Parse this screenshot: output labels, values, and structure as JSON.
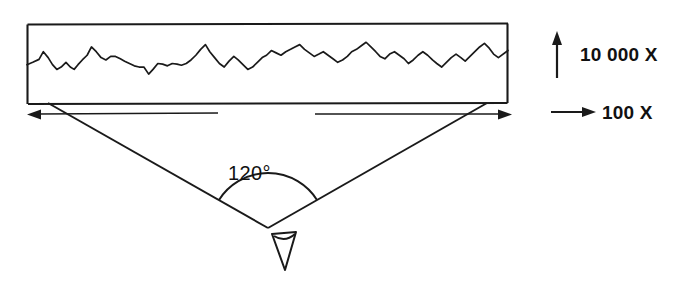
{
  "figure": {
    "background_color": "#ffffff",
    "ink_color": "#1a1a1a",
    "width": 677,
    "height": 281
  },
  "profile_box": {
    "name": "profile-trace-frame",
    "x": 27,
    "y": 24,
    "width": 481,
    "height": 79
  },
  "angle": {
    "value_label": "120°",
    "degrees": 120,
    "vertex_x": 268,
    "vertex_y": 228
  },
  "legend": {
    "vertical": {
      "label": "10 000 X",
      "magnification": 10000,
      "axis": "vertical",
      "icon": "up-arrow-icon"
    },
    "horizontal": {
      "label": "100 X",
      "magnification": 100,
      "axis": "horizontal",
      "icon": "right-arrow-icon"
    }
  },
  "dimension_arrows": {
    "left": {
      "name": "left-extent-arrow",
      "direction": "left"
    },
    "right": {
      "name": "right-extent-arrow",
      "direction": "right"
    }
  },
  "observer": {
    "name": "eye-symbol",
    "description": "eye viewing symbol at angle vertex"
  },
  "chart_data": {
    "type": "line",
    "xlabel": "",
    "ylabel": "",
    "grid": false,
    "legend_position": "right",
    "axis_note": "vertical magnification 10 000 X, horizontal magnification 100 X",
    "xlim": [
      0,
      100
    ],
    "ylim": [
      0,
      100
    ],
    "x": [
      0,
      1.2,
      2.5,
      3.4,
      4.4,
      5.3,
      6.2,
      7.1,
      8.1,
      9.0,
      9.8,
      10.6,
      11.5,
      12.5,
      13.4,
      14.4,
      15.4,
      16.4,
      17.4,
      18.4,
      19.4,
      20.3,
      21.3,
      22.3,
      23.3,
      24.3,
      25.3,
      26.2,
      27.2,
      28.2,
      29.2,
      30.2,
      31.2,
      32.1,
      33.1,
      34.1,
      35.1,
      36.1,
      37.1,
      38.0,
      39.0,
      40.0,
      41.0,
      42.0,
      43.0,
      43.9,
      44.9,
      45.9,
      46.9,
      47.9,
      48.9,
      49.8,
      50.8,
      51.8,
      52.8,
      53.8,
      54.8,
      55.7,
      56.7,
      57.7,
      58.7,
      59.7,
      60.7,
      61.6,
      62.6,
      63.6,
      64.6,
      65.6,
      66.6,
      67.5,
      68.5,
      69.5,
      70.5,
      71.5,
      72.5,
      73.4,
      74.4,
      75.4,
      76.4,
      77.4,
      78.4,
      79.3,
      80.3,
      81.3,
      82.3,
      83.3,
      84.3,
      85.2,
      86.2,
      87.2,
      88.2,
      89.2,
      90.2,
      91.1,
      92.1,
      93.1,
      94.1,
      95.1,
      96.1,
      97.0,
      98.0,
      100
    ],
    "y": [
      48,
      52,
      57,
      70,
      60,
      48,
      40,
      44,
      52,
      44,
      40,
      48,
      56,
      64,
      78,
      70,
      60,
      56,
      62,
      62,
      58,
      54,
      50,
      46,
      44,
      44,
      32,
      40,
      50,
      49,
      46,
      50,
      49,
      47,
      50,
      56,
      64,
      74,
      82,
      70,
      60,
      50,
      44,
      54,
      62,
      56,
      48,
      40,
      44,
      52,
      60,
      64,
      72,
      68,
      64,
      70,
      74,
      78,
      82,
      74,
      68,
      62,
      66,
      70,
      64,
      58,
      52,
      56,
      62,
      70,
      74,
      80,
      86,
      78,
      70,
      62,
      58,
      66,
      70,
      64,
      58,
      50,
      56,
      64,
      70,
      64,
      56,
      50,
      44,
      52,
      60,
      66,
      60,
      54,
      62,
      70,
      78,
      84,
      76,
      66,
      60,
      72
    ]
  }
}
